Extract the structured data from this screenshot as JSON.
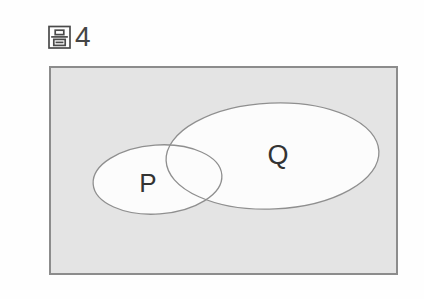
{
  "figure": {
    "label": "圖4",
    "prefix_char": "圖",
    "number": "4"
  },
  "venn": {
    "type": "venn-diagram",
    "universe_shape": "rectangle",
    "sets": [
      {
        "id": "P",
        "label": "P"
      },
      {
        "id": "Q",
        "label": "Q"
      }
    ],
    "relation": "P and Q partially overlap; intersection is non-empty and neither set contains the other"
  },
  "colors": {
    "page_background": "#fefefe",
    "universe_fill": "#e4e4e4",
    "universe_border": "#8c8c8c",
    "set_fill": "#fcfcfc",
    "set_outline": "#8f8f8f",
    "text": "#333333"
  }
}
